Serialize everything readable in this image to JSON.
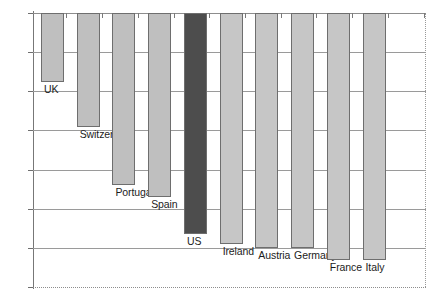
{
  "chart_data": {
    "type": "bar",
    "title": "",
    "xlabel": "",
    "ylabel": "",
    "ylim": [
      -5.5,
      -2.0
    ],
    "grid": true,
    "legend": "none",
    "orientation": "vertical-hanging",
    "baseline": -2.0,
    "y_ticks": [
      "-2",
      "-2.5",
      "-3",
      "-3.5",
      "-4",
      "-4.5",
      "-5",
      "-5.5"
    ],
    "y_tick_values": [
      -2,
      -2.5,
      -3,
      -3.5,
      -4,
      -4.5,
      -5,
      -5.5
    ],
    "categories": [
      "UK",
      "Switzerland",
      "Portugal",
      "Spain",
      "US",
      "Ireland",
      "Austria",
      "Germany",
      "France",
      "Italy"
    ],
    "values": [
      -2.88,
      -3.45,
      -4.2,
      -4.35,
      -4.82,
      -4.95,
      -5.0,
      -5.0,
      -5.15,
      -5.15
    ],
    "bar_colors": [
      "#bfbfbf",
      "#bfbfbf",
      "#bfbfbf",
      "#bfbfbf",
      "#4d4d4d",
      "#c6c6c6",
      "#c6c6c6",
      "#c6c6c6",
      "#c6c6c6",
      "#c6c6c6"
    ],
    "highlight_category": "US",
    "highlight_color": "#4d4d4d",
    "default_bar_color": "#c3c3c3",
    "bar_edge_color": "#6e6e6e"
  },
  "axis": {
    "y_labels": [
      "-2",
      "-2.5",
      "-3",
      "-3.5",
      "-4",
      "-4.5",
      "-5",
      "-5.5"
    ]
  },
  "bars": [
    {
      "label": "UK",
      "value": -2.88
    },
    {
      "label": "Switzerland",
      "value": -3.45
    },
    {
      "label": "Portugal",
      "value": -4.2
    },
    {
      "label": "Spain",
      "value": -4.35
    },
    {
      "label": "US",
      "value": -4.82
    },
    {
      "label": "Ireland",
      "value": -4.95
    },
    {
      "label": "Austria",
      "value": -5.0
    },
    {
      "label": "Germany",
      "value": -5.0
    },
    {
      "label": "France",
      "value": -5.15
    },
    {
      "label": "Italy",
      "value": -5.15
    }
  ]
}
